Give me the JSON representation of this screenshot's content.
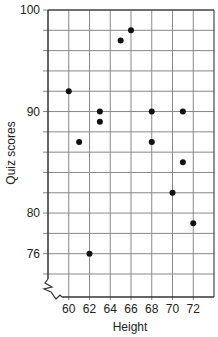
{
  "chart_data": {
    "type": "scatter",
    "title": "",
    "xlabel": "Height",
    "ylabel": "Quiz scores",
    "xlim": [
      58,
      74
    ],
    "ylim": [
      74,
      100
    ],
    "x_break": true,
    "y_break": true,
    "grid": true,
    "x_ticks": [
      60,
      62,
      64,
      66,
      68,
      70,
      72
    ],
    "x_tick_labels": [
      "60",
      "62",
      "64",
      "66",
      "68",
      "70",
      "72"
    ],
    "y_ticks": [
      100,
      90,
      80,
      76
    ],
    "y_tick_labels": [
      "100",
      "90",
      "80",
      "76"
    ],
    "grid_x_step": 2,
    "grid_y_step": 2,
    "point_color": "#111111",
    "grid_color": "#888888",
    "points": [
      {
        "x": 60,
        "y": 92
      },
      {
        "x": 61,
        "y": 87
      },
      {
        "x": 62,
        "y": 76
      },
      {
        "x": 63,
        "y": 90
      },
      {
        "x": 63,
        "y": 89
      },
      {
        "x": 65,
        "y": 97
      },
      {
        "x": 66,
        "y": 98
      },
      {
        "x": 68,
        "y": 90
      },
      {
        "x": 68,
        "y": 87
      },
      {
        "x": 70,
        "y": 82
      },
      {
        "x": 71,
        "y": 90
      },
      {
        "x": 71,
        "y": 85
      },
      {
        "x": 72,
        "y": 79
      }
    ]
  }
}
